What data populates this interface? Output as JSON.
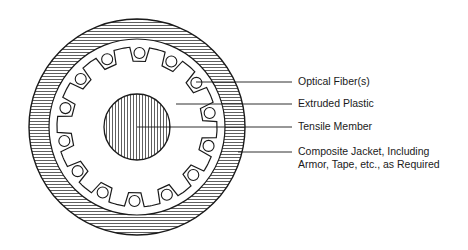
{
  "diagram": {
    "type": "cable-cross-section",
    "center": [
      137,
      127
    ],
    "outer_radius": 108,
    "jacket_inner_radius": 88,
    "core_radius": 80,
    "tensile_radius": 33,
    "fiber_count": 14,
    "colors": {
      "line": "#1a1a1a",
      "background": "#ffffff"
    }
  },
  "labels": [
    {
      "id": "optical-fiber",
      "text": "Optical Fiber(s)",
      "y": 82
    },
    {
      "id": "extruded-plastic",
      "text": "Extruded Plastic",
      "y": 104
    },
    {
      "id": "tensile-member",
      "text": "Tensile Member",
      "y": 127
    },
    {
      "id": "composite-jacket",
      "line1": "Composite Jacket, Including",
      "line2": "Armor, Tape, etc., as Required",
      "y": 152
    }
  ]
}
